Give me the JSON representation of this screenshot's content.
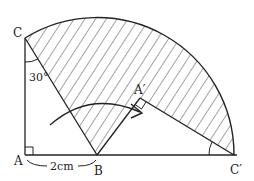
{
  "diagram": {
    "type": "geometry-rotation",
    "points": {
      "A": {
        "label": "A",
        "x": 25,
        "y": 155
      },
      "B": {
        "label": "B",
        "x": 97,
        "y": 155
      },
      "C": {
        "label": "C",
        "x": 25,
        "y": 38
      },
      "A_prime": {
        "label": "A′",
        "x": 140,
        "y": 98
      },
      "C_prime": {
        "label": "C′",
        "x": 237,
        "y": 155
      }
    },
    "labels": {
      "angle_C": "30°",
      "segment_AB": "2cm"
    },
    "colors": {
      "stroke": "#222222",
      "hatch": "#333333",
      "background": "#ffffff"
    }
  }
}
